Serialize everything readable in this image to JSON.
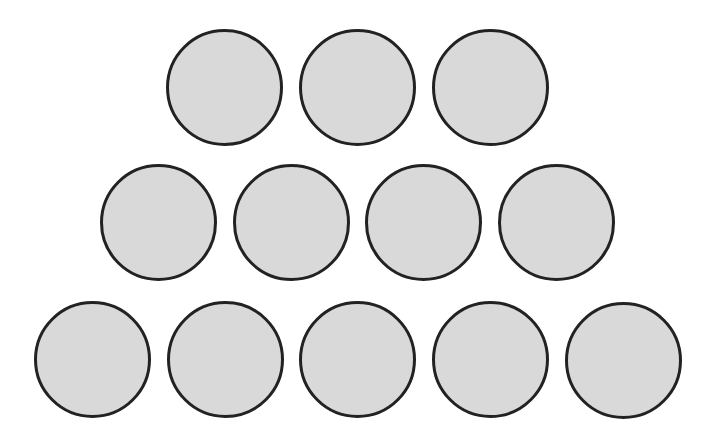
{
  "diagram": {
    "colors": {
      "background": "#ffffff",
      "fill": "#d9d9d9",
      "stroke": "#222222"
    },
    "rows": [
      {
        "name": "row-1",
        "count": 3,
        "circles": [
          {
            "x": 166,
            "y": 29,
            "d": 117
          },
          {
            "x": 299,
            "y": 29,
            "d": 117
          },
          {
            "x": 432,
            "y": 29,
            "d": 117
          }
        ]
      },
      {
        "name": "row-2",
        "count": 4,
        "circles": [
          {
            "x": 100,
            "y": 164,
            "d": 117
          },
          {
            "x": 233,
            "y": 164,
            "d": 117
          },
          {
            "x": 365,
            "y": 164,
            "d": 117
          },
          {
            "x": 498,
            "y": 164,
            "d": 117
          }
        ]
      },
      {
        "name": "row-3",
        "count": 5,
        "circles": [
          {
            "x": 34,
            "y": 301,
            "d": 117
          },
          {
            "x": 167,
            "y": 301,
            "d": 117
          },
          {
            "x": 299,
            "y": 301,
            "d": 117
          },
          {
            "x": 432,
            "y": 301,
            "d": 117
          },
          {
            "x": 565,
            "y": 302,
            "d": 117
          }
        ]
      }
    ]
  }
}
